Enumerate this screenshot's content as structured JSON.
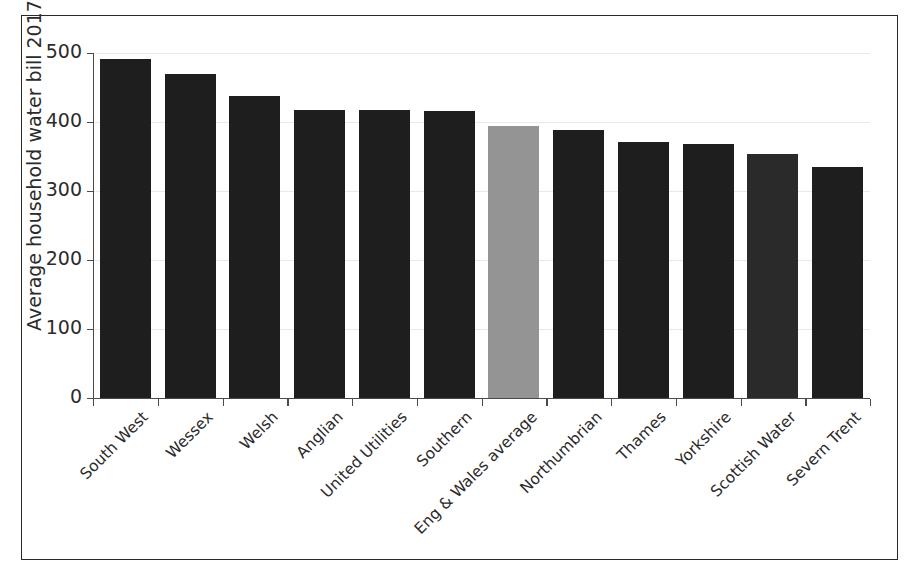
{
  "chart_data": {
    "type": "bar",
    "title": "",
    "xlabel": "",
    "ylabel": "Average household water bill 2017-18",
    "ylim": [
      0,
      500
    ],
    "yticks": [
      0,
      100,
      200,
      300,
      400,
      500
    ],
    "ytick_labels": [
      "0",
      "100",
      "200",
      "300",
      "400",
      "500"
    ],
    "grid": true,
    "legend": "none",
    "categories": [
      "South West",
      "Wessex",
      "Welsh",
      "Anglian",
      "United Utilities",
      "Southern",
      "Eng & Wales average",
      "Northumbrian",
      "Thames",
      "Yorkshire",
      "Scottish Water",
      "Severn Trent"
    ],
    "values": [
      492,
      469,
      437,
      417,
      417,
      416,
      394,
      388,
      371,
      368,
      353,
      335
    ],
    "bar_colors": [
      "#1e1e1e",
      "#1e1e1e",
      "#1e1e1e",
      "#1e1e1e",
      "#1e1e1e",
      "#1e1e1e",
      "#949494",
      "#1e1e1e",
      "#1e1e1e",
      "#1e1e1e",
      "#2a2a2a",
      "#1e1e1e"
    ],
    "highlight_category": "Eng & Wales average",
    "highlight_color": "#949494",
    "default_bar_color": "#1e1e1e",
    "axis_color": "#4a4a4a",
    "gridline_color": "#e9e9e9",
    "frame_color": "#2b2b2b",
    "background_color": "#ffffff"
  }
}
